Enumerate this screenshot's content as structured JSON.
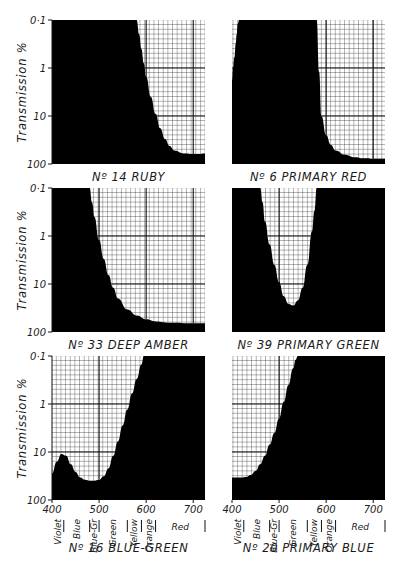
{
  "figure": {
    "y_axis_label": "Transmission %",
    "y_ticks": [
      "0·1",
      "1",
      "10",
      "100"
    ],
    "x_ticks": [
      "400",
      "500",
      "600",
      "700"
    ],
    "color_bands": [
      {
        "label": "Violet",
        "from": 400,
        "to": 425
      },
      {
        "label": "Blue",
        "from": 425,
        "to": 480
      },
      {
        "label": "Blue-Gr",
        "from": 480,
        "to": 500
      },
      {
        "label": "Green",
        "from": 500,
        "to": 560
      },
      {
        "label": "Yellow",
        "from": 560,
        "to": 590
      },
      {
        "label": "Orange",
        "from": 590,
        "to": 620
      },
      {
        "label": "Red",
        "from": 620,
        "to": 725
      }
    ],
    "colors": {
      "ink": "#000000",
      "grid": "#2a2a2a",
      "paper": "#ffffff"
    }
  },
  "chart_data": [
    {
      "type": "area",
      "title": "Nº 14 RUBY",
      "xlabel": "Wavelength (nm)",
      "ylabel": "Transmission %",
      "xlim": [
        400,
        725
      ],
      "ylim": [
        0.1,
        100
      ],
      "yscale": "log",
      "grid": true,
      "x": [
        400,
        580,
        585,
        590,
        595,
        600,
        610,
        620,
        630,
        640,
        650,
        660,
        680,
        700,
        710,
        725
      ],
      "transmission": [
        0.1,
        0.1,
        0.2,
        0.4,
        0.8,
        1.5,
        4,
        9,
        18,
        30,
        42,
        52,
        60,
        62,
        62,
        60
      ]
    },
    {
      "type": "area",
      "title": "Nº 6 PRIMARY RED",
      "xlabel": "Wavelength (nm)",
      "ylabel": "Transmission %",
      "xlim": [
        400,
        725
      ],
      "ylim": [
        0.1,
        100
      ],
      "yscale": "log",
      "grid": true,
      "x": [
        400,
        402,
        405,
        408,
        410,
        412,
        415,
        420,
        555,
        580,
        585,
        590,
        600,
        610,
        620,
        640,
        660,
        680,
        700,
        725
      ],
      "transmission": [
        1.8,
        1.0,
        0.6,
        0.3,
        0.2,
        0.12,
        0.1,
        0.1,
        0.1,
        0.1,
        1.2,
        10,
        25,
        40,
        52,
        64,
        72,
        76,
        78,
        78
      ]
    },
    {
      "type": "area",
      "title": "Nº 33 DEEP AMBER",
      "xlabel": "Wavelength (nm)",
      "ylabel": "Transmission %",
      "xlim": [
        400,
        725
      ],
      "ylim": [
        0.1,
        100
      ],
      "yscale": "log",
      "grid": true,
      "x": [
        400,
        480,
        485,
        490,
        500,
        510,
        520,
        530,
        540,
        560,
        580,
        600,
        620,
        650,
        700,
        725
      ],
      "transmission": [
        0.1,
        0.1,
        0.2,
        0.4,
        1.2,
        3,
        6.5,
        12,
        20,
        34,
        45,
        54,
        60,
        64,
        66,
        66
      ]
    },
    {
      "type": "area",
      "title": "Nº 39 PRIMARY GREEN",
      "xlabel": "Wavelength (nm)",
      "ylabel": "Transmission %",
      "xlim": [
        400,
        725
      ],
      "ylim": [
        0.1,
        100
      ],
      "yscale": "log",
      "grid": true,
      "x": [
        400,
        460,
        465,
        470,
        480,
        490,
        500,
        510,
        520,
        530,
        540,
        550,
        560,
        570,
        575,
        580,
        725
      ],
      "transmission": [
        0.1,
        0.1,
        0.2,
        0.5,
        1.5,
        4,
        9,
        18,
        26,
        28,
        22,
        12,
        4,
        0.8,
        0.3,
        0.1,
        0.1
      ]
    },
    {
      "type": "area",
      "title": "Nº 16 BLUE-GREEN",
      "xlabel": "Wavelength (nm)",
      "ylabel": "Transmission %",
      "xlim": [
        400,
        725
      ],
      "ylim": [
        0.1,
        100
      ],
      "yscale": "log",
      "grid": true,
      "x": [
        400,
        410,
        420,
        430,
        440,
        450,
        460,
        470,
        480,
        490,
        500,
        510,
        520,
        530,
        540,
        550,
        560,
        570,
        580,
        590,
        595,
        725
      ],
      "transmission": [
        28,
        16,
        11,
        12,
        18,
        26,
        34,
        38,
        40,
        40,
        38,
        32,
        22,
        12,
        6,
        2.8,
        1.3,
        0.6,
        0.3,
        0.15,
        0.1,
        0.1
      ]
    },
    {
      "type": "area",
      "title": "Nº 20 PRIMARY BLUE",
      "xlabel": "Wavelength (nm)",
      "ylabel": "Transmission %",
      "xlim": [
        400,
        725
      ],
      "ylim": [
        0.1,
        100
      ],
      "yscale": "log",
      "grid": true,
      "x": [
        400,
        420,
        430,
        440,
        450,
        460,
        470,
        480,
        490,
        500,
        510,
        520,
        530,
        535,
        540,
        725
      ],
      "transmission": [
        34,
        34,
        33,
        30,
        25,
        18,
        12,
        7,
        4,
        2,
        0.9,
        0.4,
        0.18,
        0.12,
        0.1,
        0.1
      ]
    }
  ]
}
